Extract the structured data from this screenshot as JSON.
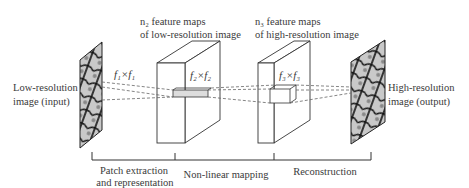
{
  "diagram": {
    "input_label": [
      "Low-resolution",
      "image (input)"
    ],
    "output_label": [
      "High-resolution",
      "image (output)"
    ],
    "layer1_maps_label": [
      "n₂ feature maps",
      "of low-resolution image"
    ],
    "layer2_maps_label": [
      "n₃ feature maps",
      "of high-resolution image"
    ],
    "filter1_label": "f₁×f₁",
    "filter2_label": "f₂×f₂",
    "filter3_label": "f₃×f₃",
    "stages": [
      {
        "label": [
          "Patch extraction",
          "and representation"
        ]
      },
      {
        "label": [
          "Non-linear mapping"
        ]
      },
      {
        "label": [
          "Reconstruction"
        ]
      }
    ],
    "colors": {
      "line": "#333333",
      "dashed": "#666666",
      "image_dark": "#1a1a1a",
      "image_light": "#bbbbbb"
    }
  }
}
